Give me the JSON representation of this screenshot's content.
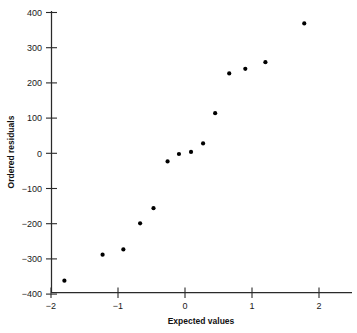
{
  "chart_data": {
    "type": "scatter",
    "title": "",
    "xlabel": "Expected values",
    "ylabel": "Ordered residuals",
    "xlim": [
      -2.0,
      2.5
    ],
    "ylim": [
      -400,
      400
    ],
    "xticks": [
      -2,
      -1,
      0,
      1,
      2
    ],
    "xtick_labels": [
      "−2",
      "−1",
      "0",
      "1",
      "2"
    ],
    "yticks": [
      400,
      300,
      200,
      100,
      0,
      -100,
      -200,
      -300,
      -400
    ],
    "ytick_labels": [
      "400",
      "300",
      "200",
      "100",
      "0",
      "−100",
      "−200",
      "−300",
      "−400"
    ],
    "grid": false,
    "legend": null,
    "marker": "filled-circle",
    "marker_color": "#000000",
    "n_points": 14,
    "x": [
      -1.8,
      -1.23,
      -0.92,
      -0.67,
      -0.47,
      -0.26,
      -0.09,
      0.09,
      0.27,
      0.45,
      0.66,
      0.9,
      1.2,
      1.78
    ],
    "y": [
      -362,
      -288,
      -273,
      -199,
      -156,
      -23,
      -2,
      4,
      28,
      114,
      227,
      240,
      259,
      369
    ],
    "points": [
      {
        "x": -1.8,
        "y": -362
      },
      {
        "x": -1.23,
        "y": -288
      },
      {
        "x": -0.92,
        "y": -273
      },
      {
        "x": -0.67,
        "y": -199
      },
      {
        "x": -0.47,
        "y": -156
      },
      {
        "x": -0.26,
        "y": -23
      },
      {
        "x": -0.09,
        "y": -2
      },
      {
        "x": 0.09,
        "y": 4
      },
      {
        "x": 0.27,
        "y": 28
      },
      {
        "x": 0.45,
        "y": 114
      },
      {
        "x": 0.66,
        "y": 227
      },
      {
        "x": 0.9,
        "y": 240
      },
      {
        "x": 1.2,
        "y": 259
      },
      {
        "x": 1.78,
        "y": 369
      }
    ]
  },
  "axes": {
    "x_title": "Expected values",
    "y_title": "Ordered residuals"
  },
  "colors": {
    "background": "#ffffff",
    "axis": "#2a2a2a",
    "marker": "#000000",
    "text": "#111111"
  }
}
